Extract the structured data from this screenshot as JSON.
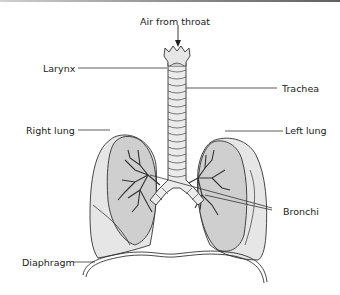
{
  "diagram": {
    "type": "anatomy",
    "labels": {
      "air_from_throat": "Air from throat",
      "larynx": "Larynx",
      "trachea": "Trachea",
      "right_lung": "Right lung",
      "left_lung": "Left lung",
      "bronchi": "Bronchi",
      "diaphragm": "Diaphragm"
    },
    "colors": {
      "lung_fill": "#cfcfcf",
      "lung_outer_fill": "#e6e6e6",
      "outline": "#333333",
      "trachea_fill": "#ebebeb",
      "background": "#ffffff"
    }
  }
}
